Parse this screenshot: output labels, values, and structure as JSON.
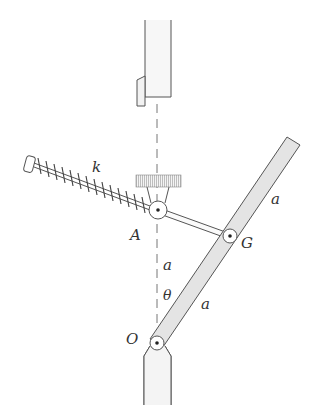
{
  "diagram": {
    "type": "mechanism",
    "labels": {
      "spring": "k",
      "pin_a": "A",
      "pin_g": "G",
      "pin_o": "O",
      "upper_bar_length": "a",
      "lower_bar_length": "a",
      "vertical_distance": "a",
      "angle": "θ"
    },
    "colors": {
      "stroke": "#555555",
      "fill_bar": "#e4e4e4",
      "fill_support": "#f2f2f2",
      "hatch": "#bdbdbd",
      "background": "#ffffff"
    }
  }
}
